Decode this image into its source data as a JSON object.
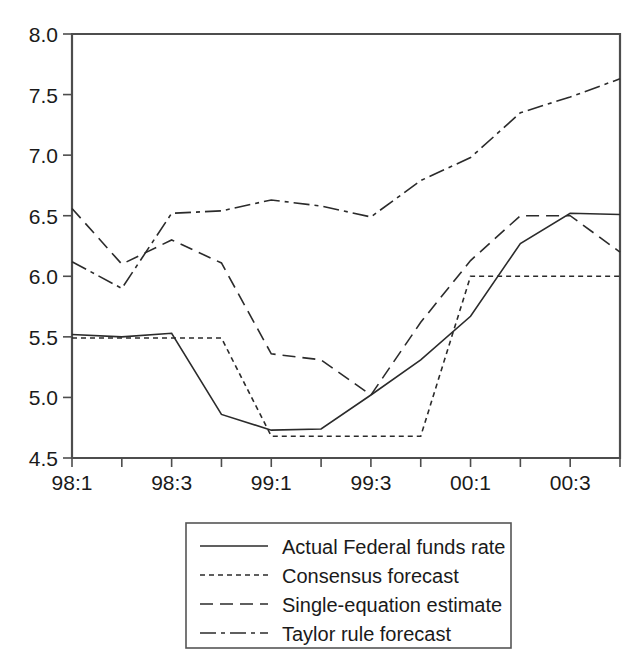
{
  "chart_data": {
    "type": "line",
    "title": "",
    "subtitle": "",
    "xlabel": "",
    "ylabel": "",
    "x": [
      "98:1",
      "98:2",
      "98:3",
      "98:4",
      "99:1",
      "99:2",
      "99:3",
      "99:4",
      "00:1",
      "00:2",
      "00:3",
      "00:4"
    ],
    "categories": [
      "98:1",
      "98:2",
      "98:3",
      "98:4",
      "99:1",
      "99:2",
      "99:3",
      "99:4",
      "00:1",
      "00:2",
      "00:3",
      "00:4"
    ],
    "xtick_labels": [
      "98:1",
      "98:3",
      "99:1",
      "99:3",
      "00:1",
      "00:3"
    ],
    "xtick_positions": [
      "98:1",
      "98:3",
      "99:1",
      "99:3",
      "00:1",
      "00:3"
    ],
    "ytick_labels": [
      "4.5",
      "5.0",
      "5.5",
      "6.0",
      "6.5",
      "7.0",
      "7.5",
      "8.0"
    ],
    "ytick_values": [
      4.5,
      5.0,
      5.5,
      6.0,
      6.5,
      7.0,
      7.5,
      8.0
    ],
    "ylim": [
      4.5,
      8.0
    ],
    "grid": false,
    "legend_position": "below-center",
    "series": [
      {
        "name": "Actual Federal funds rate",
        "style": "solid",
        "color": "#2b2b2b",
        "values": [
          5.52,
          5.5,
          5.53,
          4.86,
          4.73,
          4.74,
          5.02,
          5.31,
          5.67,
          6.27,
          6.52,
          6.51
        ]
      },
      {
        "name": "Consensus forecast",
        "style": "dotted",
        "color": "#2b2b2b",
        "values": [
          5.49,
          5.49,
          5.49,
          5.49,
          4.68,
          4.68,
          4.68,
          4.68,
          6.0,
          6.0,
          6.0,
          6.0
        ]
      },
      {
        "name": "Single-equation estimate",
        "style": "dashed",
        "color": "#2b2b2b",
        "values": [
          6.56,
          6.1,
          6.3,
          6.11,
          5.36,
          5.31,
          5.02,
          5.62,
          6.13,
          6.5,
          6.5,
          6.2
        ]
      },
      {
        "name": "Taylor rule forecast",
        "style": "dashdot",
        "color": "#2b2b2b",
        "values": [
          6.12,
          5.9,
          6.52,
          6.54,
          6.63,
          6.58,
          6.49,
          6.79,
          6.98,
          7.35,
          7.48,
          7.63
        ]
      }
    ]
  },
  "legend": {
    "entries": [
      {
        "label": "Actual Federal funds rate",
        "style": "solid"
      },
      {
        "label": "Consensus forecast",
        "style": "dotted"
      },
      {
        "label": "Single-equation estimate",
        "style": "dashed"
      },
      {
        "label": "Taylor rule forecast",
        "style": "dashdot"
      }
    ]
  }
}
